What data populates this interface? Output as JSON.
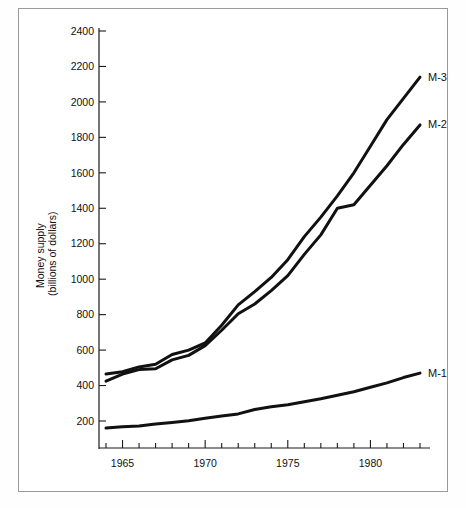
{
  "chart_data": {
    "type": "line",
    "title": "",
    "subtitle": "",
    "xlabel": "",
    "ylabel_line1": "Money supply",
    "ylabel_line2": "(billions of dollars)",
    "xlim": [
      1964,
      1983
    ],
    "ylim": [
      0,
      2400
    ],
    "grid": false,
    "legend_position": "right-inline-end-labels",
    "y_ticks": [
      200,
      400,
      600,
      800,
      1000,
      1200,
      1400,
      1600,
      1800,
      2000,
      2200,
      2400
    ],
    "y_tick_labels": [
      "200",
      "400",
      "600",
      "800",
      "1000",
      "1200",
      "1400",
      "1600",
      "1800",
      "2000",
      "2200",
      "2400"
    ],
    "x_ticks_all": [
      1964,
      1965,
      1966,
      1967,
      1968,
      1969,
      1970,
      1971,
      1972,
      1973,
      1974,
      1975,
      1976,
      1977,
      1978,
      1979,
      1980,
      1981,
      1982,
      1983
    ],
    "x_ticks_labeled": [
      1965,
      1970,
      1975,
      1980
    ],
    "x_tick_labels": [
      "1965",
      "1970",
      "1975",
      "1980"
    ],
    "x": [
      1964,
      1965,
      1966,
      1967,
      1968,
      1969,
      1970,
      1971,
      1972,
      1973,
      1974,
      1975,
      1976,
      1977,
      1978,
      1979,
      1980,
      1981,
      1982,
      1983
    ],
    "series": [
      {
        "name": "M-1",
        "label": "M-1",
        "color": "#111111",
        "values": [
          160,
          167,
          172,
          183,
          192,
          202,
          215,
          228,
          240,
          265,
          280,
          292,
          308,
          325,
          345,
          365,
          390,
          415,
          445,
          470
        ]
      },
      {
        "name": "M-2",
        "label": "M-2",
        "color": "#111111",
        "values": [
          425,
          465,
          490,
          495,
          545,
          570,
          625,
          712,
          805,
          860,
          935,
          1020,
          1140,
          1250,
          1400,
          1420,
          1530,
          1640,
          1760,
          1870
        ]
      },
      {
        "name": "M-3",
        "label": "M-3",
        "color": "#111111",
        "values": [
          465,
          478,
          505,
          520,
          575,
          600,
          640,
          740,
          855,
          930,
          1010,
          1110,
          1240,
          1350,
          1470,
          1600,
          1750,
          1900,
          2020,
          2140
        ]
      }
    ]
  },
  "labels": {
    "m1": "M-1",
    "m2": "M-2",
    "m3": "M-3"
  },
  "colors": {
    "line": "#111111",
    "axis": "#1a1a1a",
    "frame": "#9a9a9a",
    "background": "#ffffff"
  }
}
